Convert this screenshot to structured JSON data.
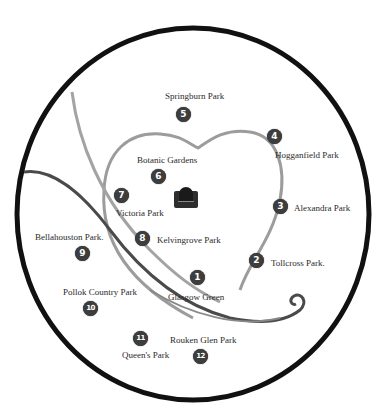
{
  "map": {
    "type": "illustrated park map",
    "center_icon": "bandstand-icon",
    "colors": {
      "circle_border": "#111111",
      "river": "#4a4a4a",
      "heart_path": "#9a9a9a",
      "badge": "#3d3d3d",
      "text": "#2a2a2a"
    },
    "parks": [
      {
        "number": "1",
        "name": "Glasgow Green"
      },
      {
        "number": "2",
        "name": "Tollcross Park."
      },
      {
        "number": "3",
        "name": "Alexandra Park"
      },
      {
        "number": "4",
        "name": "Hogganfield Park"
      },
      {
        "number": "5",
        "name": "Springburn Park"
      },
      {
        "number": "6",
        "name": "Botanic Gardens"
      },
      {
        "number": "7",
        "name": "Victoria Park"
      },
      {
        "number": "8",
        "name": "Kelvingrove Park"
      },
      {
        "number": "9",
        "name": "Bellahouston Park."
      },
      {
        "number": "10",
        "name": "Pollok Country Park"
      },
      {
        "number": "11",
        "name": "Queen's Park"
      },
      {
        "number": "12",
        "name": "Rouken Glen Park"
      }
    ]
  }
}
